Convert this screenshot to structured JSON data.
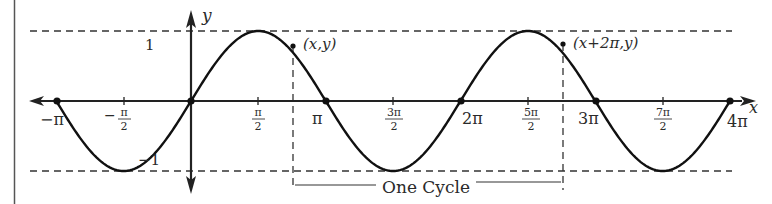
{
  "figure": {
    "function": "y = sin x",
    "colors": {
      "curve": "#111111",
      "axis": "#222222",
      "dashed": "#333333",
      "text": "#2a2a2a",
      "background": "#ffffff"
    }
  },
  "axes": {
    "x_label": "x",
    "y_label": "y",
    "y_tick_labels": {
      "pos": "1",
      "neg": "−1"
    },
    "x_ticks": [
      {
        "value": -3.14159,
        "label": "−π",
        "frac": false
      },
      {
        "value": -1.5708,
        "num": "π",
        "den": "2",
        "sign": "−",
        "frac": true
      },
      {
        "value": 1.5708,
        "num": "π",
        "den": "2",
        "frac": true
      },
      {
        "value": 3.14159,
        "label": "π",
        "frac": false
      },
      {
        "value": 4.7124,
        "num": "3π",
        "den": "2",
        "frac": true
      },
      {
        "value": 6.28319,
        "label": "2π",
        "frac": false
      },
      {
        "value": 7.854,
        "num": "5π",
        "den": "2",
        "frac": true
      },
      {
        "value": 9.4248,
        "label": "3π",
        "frac": false
      },
      {
        "value": 10.9956,
        "num": "7π",
        "den": "2",
        "frac": true
      },
      {
        "value": 12.5664,
        "label": "4π",
        "frac": false
      }
    ]
  },
  "annotations": {
    "point_1": "(x,y)",
    "point_2": "(x+2π,y)",
    "cycle_label": "One Cycle"
  },
  "chart_data": {
    "type": "line",
    "xlabel": "x",
    "ylabel": "y",
    "xlim": [
      -3.14159,
      12.5664
    ],
    "ylim": [
      -1,
      1
    ],
    "grid": false,
    "series": [
      {
        "name": "sin x",
        "x": [
          -3.1416,
          -2.3562,
          -1.5708,
          -0.7854,
          0,
          0.7854,
          1.5708,
          2.3562,
          3.1416,
          3.927,
          4.7124,
          5.4978,
          6.2832,
          7.0686,
          7.854,
          8.6394,
          9.4248,
          10.2102,
          10.9956,
          11.781,
          12.5664
        ],
        "values": [
          0,
          -0.707,
          -1,
          -0.707,
          0,
          0.707,
          1,
          0.707,
          0,
          -0.707,
          -1,
          -0.707,
          0,
          0.707,
          1,
          0.707,
          0,
          -0.707,
          -1,
          -0.707,
          0
        ]
      }
    ],
    "marked_points": [
      {
        "label": "(x,y)",
        "x": 2.38,
        "y": 0.69
      },
      {
        "label": "(x+2π,y)",
        "x": 8.66,
        "y": 0.69
      }
    ],
    "zeros_marked": [
      -3.1416,
      0,
      3.1416,
      6.2832,
      9.4248,
      12.5664
    ],
    "annotations": [
      "One Cycle spans from x to x+2π"
    ]
  }
}
